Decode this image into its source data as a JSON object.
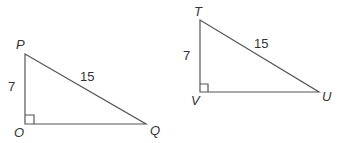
{
  "triangles": [
    {
      "name": "PQO",
      "vertices": {
        "top": "P",
        "right_angle": "O",
        "far": "Q"
      },
      "sides": {
        "leg": "7",
        "hypotenuse": "15"
      },
      "right_angle_at": "O"
    },
    {
      "name": "TUV",
      "vertices": {
        "top": "T",
        "right_angle": "V",
        "far": "U"
      },
      "sides": {
        "leg": "7",
        "hypotenuse": "15"
      },
      "right_angle_at": "V"
    }
  ],
  "colors": {
    "line": "#555555",
    "text": "#333333",
    "background": "#ffffff"
  }
}
